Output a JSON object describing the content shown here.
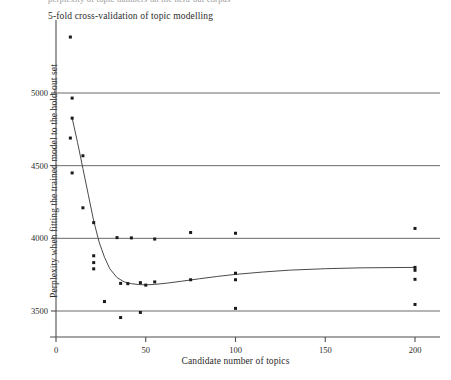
{
  "figure": {
    "caption_sliver": "perplexity of topic numbers on the held-out corpus",
    "colors": {
      "axis": "#4d4d4d",
      "gridline": "#595959",
      "point": "#1a1a1a",
      "curve": "#4a4a4a",
      "background": "#ffffff"
    }
  },
  "chart_data": {
    "type": "scatter",
    "title": "5-fold cross-validation of topic modelling",
    "xlabel": "Candidate number of topics",
    "ylabel": "Perplexity when fitting the trained model to the hold-out set",
    "xlim": [
      -5,
      212
    ],
    "ylim": [
      3390,
      5450
    ],
    "xticks": [
      0,
      50,
      100,
      150,
      200
    ],
    "xtick_labels": [
      "0",
      "50",
      "100",
      "150",
      "200"
    ],
    "yticks": [
      3500,
      4000,
      4500,
      5000
    ],
    "ytick_labels": [
      "3500",
      "4000",
      "4500",
      "5000"
    ],
    "grid": "horizontal-only",
    "legend": "none",
    "series": [
      {
        "name": "fold perplexity",
        "type": "scatter",
        "points": [
          [
            8,
            5385
          ],
          [
            9,
            4965
          ],
          [
            9,
            4827
          ],
          [
            8,
            4690
          ],
          [
            15,
            4568
          ],
          [
            9,
            4450
          ],
          [
            15,
            4210
          ],
          [
            21,
            4108
          ],
          [
            34,
            4005
          ],
          [
            21,
            3880
          ],
          [
            21,
            3833
          ],
          [
            21,
            3790
          ],
          [
            42,
            4003
          ],
          [
            55,
            3995
          ],
          [
            75,
            4040
          ],
          [
            100,
            4035
          ],
          [
            200,
            4068
          ],
          [
            36,
            3690
          ],
          [
            40,
            3688
          ],
          [
            47,
            3695
          ],
          [
            50,
            3678
          ],
          [
            55,
            3700
          ],
          [
            75,
            3715
          ],
          [
            100,
            3760
          ],
          [
            100,
            3715
          ],
          [
            200,
            3800
          ],
          [
            200,
            3780
          ],
          [
            200,
            3718
          ],
          [
            27,
            3565
          ],
          [
            36,
            3455
          ],
          [
            47,
            3490
          ],
          [
            100,
            3518
          ],
          [
            200,
            3545
          ]
        ]
      },
      {
        "name": "fitted loess curve",
        "type": "line",
        "points": [
          [
            9,
            4827
          ],
          [
            12,
            4660
          ],
          [
            15,
            4480
          ],
          [
            18,
            4300
          ],
          [
            21,
            4120
          ],
          [
            24,
            3975
          ],
          [
            27,
            3870
          ],
          [
            30,
            3790
          ],
          [
            34,
            3730
          ],
          [
            38,
            3700
          ],
          [
            42,
            3688
          ],
          [
            46,
            3682
          ],
          [
            50,
            3680
          ],
          [
            55,
            3683
          ],
          [
            62,
            3692
          ],
          [
            70,
            3705
          ],
          [
            80,
            3722
          ],
          [
            90,
            3738
          ],
          [
            100,
            3752
          ],
          [
            115,
            3768
          ],
          [
            130,
            3781
          ],
          [
            150,
            3791
          ],
          [
            170,
            3797
          ],
          [
            200,
            3800
          ]
        ]
      }
    ]
  }
}
